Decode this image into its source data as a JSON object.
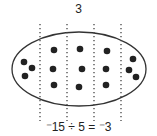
{
  "diagram": {
    "top_label": "3",
    "equation": "⁻15 ÷ 5 = ⁻3",
    "total_counters": 15,
    "groups": 5,
    "per_group": 3,
    "dot_color": "#222222",
    "ellipse_color": "#333333",
    "divider_color": "#444444"
  }
}
